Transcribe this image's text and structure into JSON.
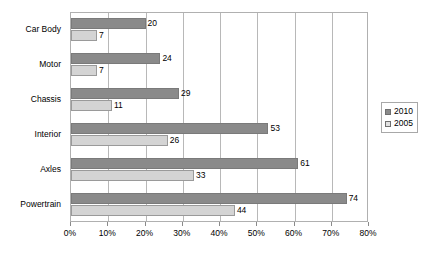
{
  "chart_data": {
    "type": "bar",
    "orientation": "horizontal",
    "title": "",
    "xlabel": "",
    "ylabel": "",
    "xlim": [
      0,
      80
    ],
    "x_tick_labels": [
      "0%",
      "10%",
      "20%",
      "30%",
      "40%",
      "50%",
      "60%",
      "70%",
      "80%"
    ],
    "x_tick_values": [
      0,
      10,
      20,
      30,
      40,
      50,
      60,
      70,
      80
    ],
    "grid": true,
    "legend_position": "right",
    "categories": [
      "Car Body",
      "Motor",
      "Chassis",
      "Interior",
      "Axles",
      "Powertrain"
    ],
    "series": [
      {
        "name": "2010",
        "color": "#8a8a8a",
        "values": [
          20,
          24,
          29,
          53,
          61,
          74
        ]
      },
      {
        "name": "2005",
        "color": "#d4d4d4",
        "values": [
          7,
          7,
          11,
          26,
          33,
          44
        ]
      }
    ],
    "value_label_suffix": ""
  },
  "legend": {
    "items": [
      {
        "label": "2010"
      },
      {
        "label": "2005"
      }
    ]
  }
}
